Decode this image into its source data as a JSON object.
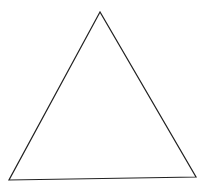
{
  "diagram": {
    "shape": "triangle",
    "stroke_color": "#222222",
    "fill_color": "#ffffff",
    "vertices": [
      [
        100,
        12
      ],
      [
        9,
        180
      ],
      [
        196,
        177
      ]
    ]
  }
}
